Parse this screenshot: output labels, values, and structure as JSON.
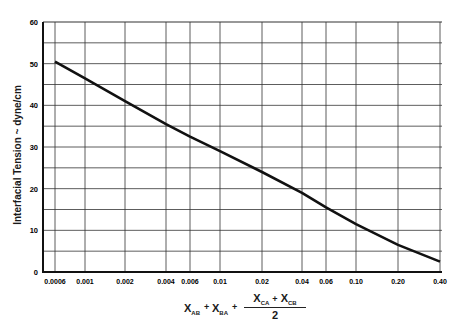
{
  "chart_data": {
    "type": "line",
    "title": "",
    "xlabel": "X_AB + X_BA + (X_CA + X_CB)/2",
    "ylabel": "Interfacial Tension ~ dyne/cm",
    "xscale": "log",
    "xlim": [
      0.0006,
      0.4
    ],
    "ylim": [
      0,
      60
    ],
    "grid": true,
    "legend": null,
    "x_ticks": [
      "0.0006",
      "0.001",
      "0.002",
      "0.004",
      "0.006",
      "0.01",
      "0.02",
      "0.04",
      "0.06",
      "0.10",
      "0.20",
      "0.40"
    ],
    "y_ticks": [
      "0",
      "10",
      "20",
      "30",
      "40",
      "50",
      "60"
    ],
    "series": [
      {
        "name": "Interfacial Tension",
        "x": [
          0.0006,
          0.001,
          0.002,
          0.004,
          0.006,
          0.01,
          0.02,
          0.04,
          0.06,
          0.1,
          0.2,
          0.4
        ],
        "y": [
          50.5,
          46.5,
          41,
          35.5,
          32.5,
          29,
          24,
          19,
          15.5,
          11.5,
          6.5,
          2.5
        ]
      }
    ]
  },
  "labels": {
    "ylabel": "Interfacial Tension ~ dyne/cm",
    "x_terms": {
      "t1": "X",
      "t1_sub": "AB",
      "plus1": "+",
      "t2": "X",
      "t2_sub": "BA",
      "plus2": "+",
      "t3": "X",
      "t3_sub": "CA",
      "plus3": "+",
      "t4": "X",
      "t4_sub": "CB",
      "denominator": "2"
    }
  }
}
